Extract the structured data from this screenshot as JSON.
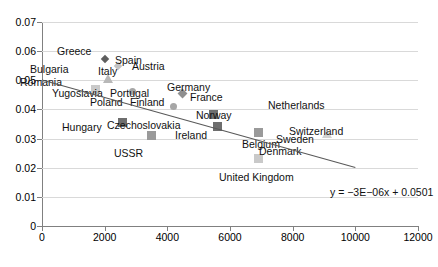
{
  "chart_data": {
    "type": "scatter",
    "title": "",
    "xlabel": "",
    "ylabel": "",
    "xlim": [
      0,
      12000
    ],
    "ylim": [
      0,
      0.07
    ],
    "grid": true,
    "legend": "none",
    "xticks": [
      "0",
      "2000",
      "4000",
      "6000",
      "8000",
      "10000",
      "12000"
    ],
    "xtick_values": [
      0,
      2000,
      4000,
      6000,
      8000,
      10000,
      12000
    ],
    "yticks": [
      "0",
      "0.01",
      "0.02",
      "0.03",
      "0.04",
      "0.05",
      "0.06",
      "0.07"
    ],
    "ytick_values": [
      0,
      0.01,
      0.02,
      0.03,
      0.04,
      0.05,
      0.06,
      0.07
    ],
    "points": [
      {
        "name": "Greece",
        "x": 2020,
        "y": 0.0573,
        "marker": "diamond-dark",
        "label_pos": "left"
      },
      {
        "name": "Spain",
        "x": 2430,
        "y": 0.0548,
        "marker": "diamond-light",
        "label_pos": "right"
      },
      {
        "name": "Bulgaria",
        "x": 2120,
        "y": 0.0505,
        "marker": "triangle",
        "label_pos": "left"
      },
      {
        "name": "Austria",
        "x": 4130,
        "y": 0.05,
        "marker": "none",
        "label_pos": "center"
      },
      {
        "name": "Romania",
        "x": 1700,
        "y": 0.0468,
        "marker": "square-light",
        "label_pos": "left"
      },
      {
        "name": "Italy",
        "x": 2900,
        "y": 0.0462,
        "marker": "circle",
        "label_pos": "above"
      },
      {
        "name": "Yugoslavia",
        "x": 2100,
        "y": 0.0452,
        "marker": "none",
        "label_pos": "below"
      },
      {
        "name": "Germany",
        "x": 4490,
        "y": 0.0455,
        "marker": "diamond",
        "label_pos": "right"
      },
      {
        "name": "Portugal",
        "x": 3200,
        "y": 0.0432,
        "marker": "none",
        "label_pos": "center"
      },
      {
        "name": "France",
        "x": 4980,
        "y": 0.0433,
        "marker": "none",
        "label_pos": "center"
      },
      {
        "name": "Poland",
        "x": 2400,
        "y": 0.0415,
        "marker": "none",
        "label_pos": "center"
      },
      {
        "name": "Finland",
        "x": 4200,
        "y": 0.041,
        "marker": "circle",
        "label_pos": "left"
      },
      {
        "name": "Norway",
        "x": 5480,
        "y": 0.0383,
        "marker": "square-dark",
        "label_pos": "above"
      },
      {
        "name": "Czechoslovakia",
        "x": 2570,
        "y": 0.0355,
        "marker": "square-dark",
        "label_pos": "right"
      },
      {
        "name": "Hungary",
        "x": 1900,
        "y": 0.035,
        "marker": "none",
        "label_pos": "left"
      },
      {
        "name": "Ireland",
        "x": 5590,
        "y": 0.0341,
        "marker": "square-dark",
        "label_pos": "left"
      },
      {
        "name": "USSR",
        "x": 3500,
        "y": 0.031,
        "marker": "square",
        "label_pos": "below"
      },
      {
        "name": "Netherlands",
        "x": 8200,
        "y": 0.0432,
        "marker": "none",
        "label_pos": "center"
      },
      {
        "name": "Belgium",
        "x": 6900,
        "y": 0.0322,
        "marker": "square",
        "label_pos": "left"
      },
      {
        "name": "Sweden",
        "x": 7500,
        "y": 0.0318,
        "marker": "none",
        "label_pos": "center"
      },
      {
        "name": "Switzerland",
        "x": 9100,
        "y": 0.0315,
        "marker": "triangle-light",
        "label_pos": "above"
      },
      {
        "name": "Denmark",
        "x": 7050,
        "y": 0.0302,
        "marker": "none",
        "label_pos": "center"
      },
      {
        "name": "United Kingdom",
        "x": 6900,
        "y": 0.0232,
        "marker": "square-light",
        "label_pos": "left"
      }
    ],
    "trendline": {
      "equation": "y = −3E−06x + 0.0501",
      "slope": -3e-06,
      "intercept": 0.0501,
      "x_start": 0,
      "x_end": 10000
    }
  }
}
